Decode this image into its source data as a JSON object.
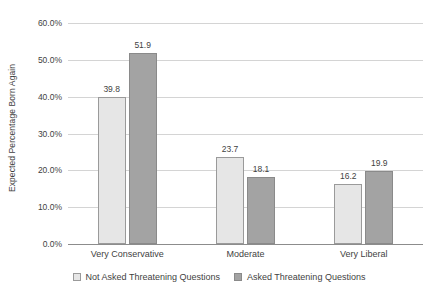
{
  "chart_data": {
    "type": "bar",
    "title": "",
    "xlabel": "",
    "ylabel": "Expected Percentage Born Again",
    "ylim": [
      0,
      60
    ],
    "ytick_labels": [
      "60.0%",
      "50.0%",
      "40.0%",
      "30.0%",
      "20.0%",
      "10.0%",
      "0.0%"
    ],
    "ytick_values": [
      60,
      50,
      40,
      30,
      20,
      10,
      0
    ],
    "grid": true,
    "legend_position": "bottom",
    "categories": [
      "Very Conservative",
      "Moderate",
      "Very Liberal"
    ],
    "series": [
      {
        "name": "Not Asked Threatening Questions",
        "color": "#e6e6e6",
        "values": [
          39.8,
          23.7,
          16.2
        ],
        "labels": [
          "39.8",
          "23.7",
          "16.2"
        ]
      },
      {
        "name": "Asked Threatening Questions",
        "color": "#a3a3a3",
        "values": [
          51.9,
          18.1,
          19.9
        ],
        "labels": [
          "51.9",
          "18.1",
          "19.9"
        ]
      }
    ]
  }
}
